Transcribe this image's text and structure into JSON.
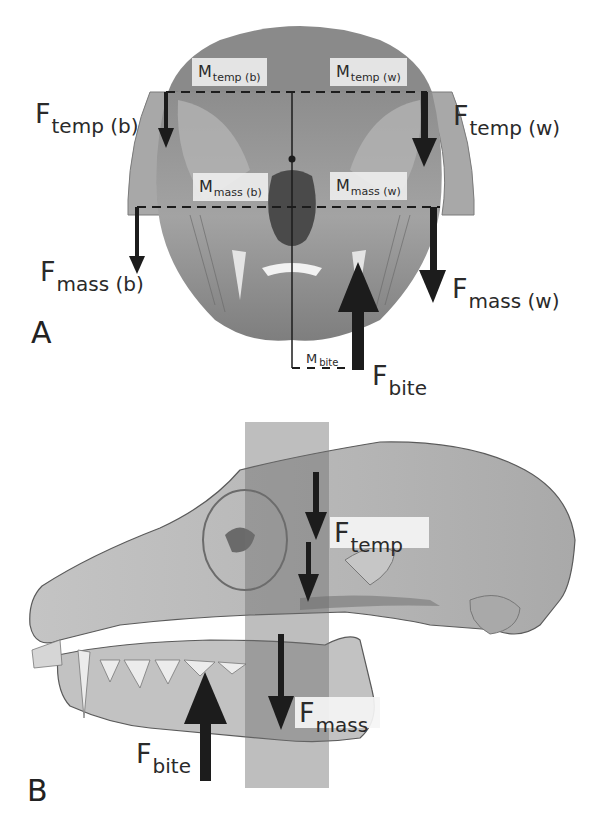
{
  "figure": {
    "panels": [
      {
        "id": "A",
        "letter": "A",
        "view": "frontal skull view with muscles",
        "force_labels": {
          "ftemp_b": {
            "main": "F",
            "sub": "temp (b)"
          },
          "ftemp_w": {
            "main": "F",
            "sub": "temp (w)"
          },
          "fmass_b": {
            "main": "F",
            "sub": "mass (b)"
          },
          "fmass_w": {
            "main": "F",
            "sub": "mass (w)"
          },
          "fbite": {
            "main": "F",
            "sub": "bite"
          }
        },
        "moment_labels": {
          "mtemp_b": {
            "main": "M",
            "sub": "temp (b)"
          },
          "mtemp_w": {
            "main": "M",
            "sub": "temp (w)"
          },
          "mmass_b": {
            "main": "M",
            "sub": "mass (b)"
          },
          "mmass_w": {
            "main": "M",
            "sub": "mass (w)"
          },
          "mbite": {
            "main": "M",
            "sub": "bite"
          }
        }
      },
      {
        "id": "B",
        "letter": "B",
        "view": "lateral skull view",
        "force_labels": {
          "ftemp": {
            "main": "F",
            "sub": "temp"
          },
          "fmass": {
            "main": "F",
            "sub": "mass"
          },
          "fbite": {
            "main": "F",
            "sub": "bite"
          }
        }
      }
    ],
    "colors": {
      "arrow": "#1c1c1c",
      "skull_fill": "#9a9a9a",
      "skull_light": "#c9c9c9",
      "band": "#7a7a7a",
      "label_box": "#f0f0f0"
    }
  }
}
